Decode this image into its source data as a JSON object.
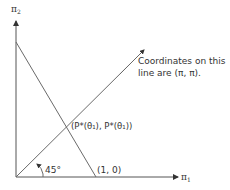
{
  "diagram": {
    "axes": {
      "y_label": "π",
      "y_label_sub": "2",
      "x_label": "π",
      "x_label_sub": "1"
    },
    "lines": {
      "budget_line_intercept_label": "(1, 0)",
      "diagonal_angle_label": "45°"
    },
    "intersection_label": "(P*(θ₁), P*(θ₁))",
    "annotation": {
      "line1": "Coordinates on this",
      "line2": "line are (π, π)."
    }
  }
}
